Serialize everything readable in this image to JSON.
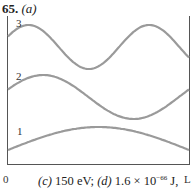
{
  "problem": {
    "number": "65.",
    "part_label": "(a)"
  },
  "chart_data": {
    "type": "line",
    "title": "65. (a)",
    "xlabel": "",
    "ylabel": "",
    "x_ticks": [
      "0",
      "L"
    ],
    "x_range": [
      0,
      1
    ],
    "grid": false,
    "legend": "none",
    "series": [
      {
        "name": "1",
        "description": "n=1 standing wave, half wavelength between 0 and L",
        "n": 1,
        "label_y_px": 149,
        "baseline_px": 150,
        "amplitude_px": 23
      },
      {
        "name": "2",
        "description": "n=2 standing wave, full wavelength between 0 and L",
        "n": 2,
        "label_y_px": 94,
        "baseline_px": 97,
        "amplitude_px": 22
      },
      {
        "name": "3",
        "description": "n=3 standing wave, 1.5 wavelengths between 0 and L",
        "n": 3,
        "label_y_px": 26,
        "baseline_px": 47,
        "amplitude_px": 22
      }
    ],
    "line_color": "#9a9a9a"
  },
  "caption": {
    "c_label": "(c)",
    "c_value": "150 eV;",
    "d_label": "(d)",
    "d_value": "1.6 × 10",
    "d_exponent": "−66",
    "d_unit": "J,"
  },
  "axis": {
    "x_start": "0",
    "x_end": "L"
  },
  "labels": {
    "n1": "1",
    "n2": "2",
    "n3": "3"
  }
}
